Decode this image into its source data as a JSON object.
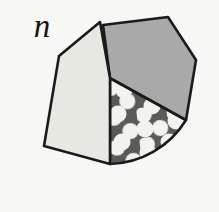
{
  "figure": {
    "label": "n",
    "background_color": "#f7f7f5",
    "outline_color": "#1b1b1b",
    "outline_width": 2.6,
    "panels": [
      {
        "name": "left-light-panel",
        "fill_color": "#e8e8e3",
        "pattern": "none",
        "points": "100,22 59,56 44,146 110,164 110,78"
      },
      {
        "name": "top-right-gray-panel",
        "fill_color": "#a9a9a9",
        "pattern": "none",
        "points": "103,25 168,17 196,60 186,120 110,78"
      },
      {
        "name": "bottom-dotted-panel",
        "fill_color": "#5a5a5a",
        "pattern": "polka-dots",
        "dot_color": "#f2f2ee",
        "dot_radius": 8,
        "points": "110,78 186,120 110,164"
      }
    ],
    "arc": {
      "name": "curved-right-edge",
      "from": "186,120",
      "to": "110,164",
      "radius": 92
    }
  }
}
